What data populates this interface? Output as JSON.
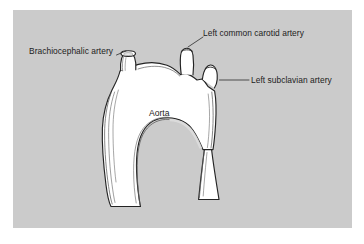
{
  "figure": {
    "kind": "anatomical-illustration",
    "background_color": "#cbcbcb",
    "page_color": "#ffffff",
    "vessel_fill": "#ffffff",
    "outline_color": "#232323",
    "text_color": "#1c1c1c"
  },
  "labels": {
    "brachiocephalic": "Brachiocephalic artery",
    "left_common_carotid": "Left common carotid artery",
    "left_subclavian": "Left subclavian artery",
    "aorta": "Aorta"
  }
}
